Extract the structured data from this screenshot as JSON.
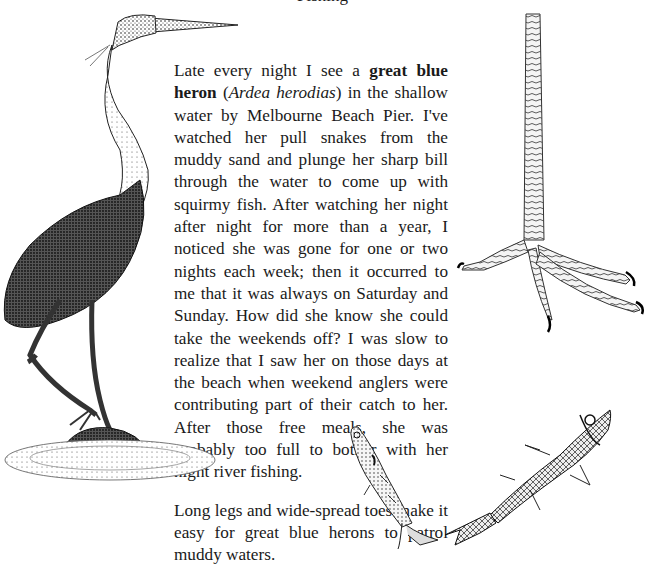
{
  "page": {
    "title": "Fishing",
    "paragraphs": [
      {
        "before_bold": "Late every night I see a ",
        "bold": "great blue heron",
        "between": " (",
        "italic": "Ardea herodias",
        "after": ") in the shallow water by Melbourne Beach Pier. I've watched her pull snakes from the muddy sand and plunge her sharp bill through the water to come up with squirmy fish. After watching her night after night for more than a year, I noticed she was gone for one or two nights each week; then it occurred to me that it was always on Saturday and Sunday. How did she know she could take the weekends off? I was slow to realize that I saw her on those days at the beach when weekend anglers were contributing part of their catch to her. After those free meals, she was probably too full to bother with her night river fishing."
      },
      {
        "text": "Long legs and wide-spread toes make it easy for great blue herons to patrol muddy waters."
      }
    ]
  },
  "illustrations": {
    "heron": "great-blue-heron-drawing",
    "foot": "heron-foot-drawing",
    "fish_small": "small-fish-drawing",
    "fish_large": "large-fish-drawing"
  }
}
